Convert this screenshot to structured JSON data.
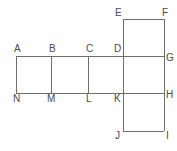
{
  "figure": {
    "name": "cube-net-diagram",
    "background_color": "#fefefe",
    "line_color": "#6e6e6e",
    "label_color": "#4a4a4a",
    "line_width": 1,
    "canvas": {
      "width": 177,
      "height": 151
    }
  },
  "geometry": {
    "strip_left": 16,
    "strip_right": 164,
    "strip_top": 56,
    "strip_bottom": 93,
    "divider_x": [
      51,
      88,
      123
    ],
    "top_square": {
      "left": 123,
      "right": 164,
      "top": 19,
      "bottom": 56
    },
    "bottom_square": {
      "left": 123,
      "right": 164,
      "top": 93,
      "bottom": 131
    }
  },
  "segments": [
    {
      "name": "strip-top-edge",
      "x1": 16,
      "y1": 56,
      "x2": 164,
      "y2": 56
    },
    {
      "name": "strip-bottom-edge",
      "x1": 16,
      "y1": 93,
      "x2": 164,
      "y2": 93
    },
    {
      "name": "strip-left-edge-AN",
      "x1": 16,
      "y1": 56,
      "x2": 16,
      "y2": 93
    },
    {
      "name": "divider-BM",
      "x1": 51,
      "y1": 56,
      "x2": 51,
      "y2": 93
    },
    {
      "name": "divider-CL",
      "x1": 88,
      "y1": 56,
      "x2": 88,
      "y2": 93
    },
    {
      "name": "divider-DK",
      "x1": 123,
      "y1": 19,
      "x2": 123,
      "y2": 131
    },
    {
      "name": "strip-right-edge-GH",
      "x1": 164,
      "y1": 19,
      "x2": 164,
      "y2": 131
    },
    {
      "name": "top-square-top-edge-EF",
      "x1": 123,
      "y1": 19,
      "x2": 164,
      "y2": 19
    },
    {
      "name": "bottom-square-bottom-edge-JI",
      "x1": 123,
      "y1": 131,
      "x2": 164,
      "y2": 131
    }
  ],
  "labels": [
    {
      "name": "vertex-label-A",
      "text": "A",
      "x": 14,
      "y": 44
    },
    {
      "name": "vertex-label-B",
      "text": "B",
      "x": 49,
      "y": 44
    },
    {
      "name": "vertex-label-C",
      "text": "C",
      "x": 86,
      "y": 44
    },
    {
      "name": "vertex-label-D",
      "text": "D",
      "x": 114,
      "y": 44
    },
    {
      "name": "vertex-label-E",
      "text": "E",
      "x": 115,
      "y": 8
    },
    {
      "name": "vertex-label-F",
      "text": "F",
      "x": 162,
      "y": 8
    },
    {
      "name": "vertex-label-G",
      "text": "G",
      "x": 166,
      "y": 53
    },
    {
      "name": "vertex-label-H",
      "text": "H",
      "x": 166,
      "y": 90
    },
    {
      "name": "vertex-label-I",
      "text": "I",
      "x": 166,
      "y": 131
    },
    {
      "name": "vertex-label-J",
      "text": "J",
      "x": 115,
      "y": 131
    },
    {
      "name": "vertex-label-K",
      "text": "K",
      "x": 114,
      "y": 94
    },
    {
      "name": "vertex-label-L",
      "text": "L",
      "x": 86,
      "y": 94
    },
    {
      "name": "vertex-label-M",
      "text": "M",
      "x": 47,
      "y": 94
    },
    {
      "name": "vertex-label-N",
      "text": "N",
      "x": 13,
      "y": 94
    }
  ]
}
